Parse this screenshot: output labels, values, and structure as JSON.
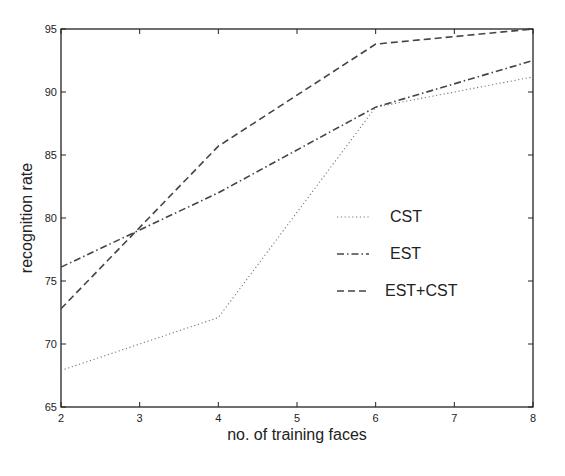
{
  "chart_data": {
    "type": "line",
    "title": "",
    "xlabel": "no. of training faces",
    "ylabel": "recognition rate",
    "x": [
      2,
      4,
      6,
      8
    ],
    "xlim": [
      2,
      8
    ],
    "ylim": [
      65,
      95
    ],
    "xticks": [
      2,
      3,
      4,
      5,
      6,
      7,
      8
    ],
    "yticks": [
      65,
      70,
      75,
      80,
      85,
      90,
      95
    ],
    "grid": false,
    "legend_position": "inside-right",
    "series": [
      {
        "name": "CST",
        "legend_symbol": "......",
        "style": "dotted",
        "values": [
          67.9,
          72.1,
          88.8,
          91.2
        ]
      },
      {
        "name": "EST",
        "legend_symbol": "-.-.",
        "style": "dashdot",
        "values": [
          76.1,
          82.0,
          88.8,
          92.5
        ]
      },
      {
        "name": "EST+CST",
        "legend_symbol": "---",
        "style": "dashed",
        "values": [
          72.8,
          85.7,
          93.8,
          95.0
        ]
      }
    ]
  },
  "colors": {
    "line": "#444444",
    "axis": "#222222",
    "background": "#ffffff"
  }
}
